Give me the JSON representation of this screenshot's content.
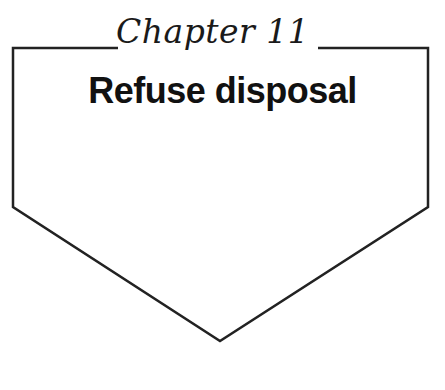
{
  "chapter_label": "Chapter 11",
  "title": "Refuse disposal",
  "colors": {
    "stroke": "#222222",
    "text": "#111111",
    "background": "#ffffff"
  }
}
